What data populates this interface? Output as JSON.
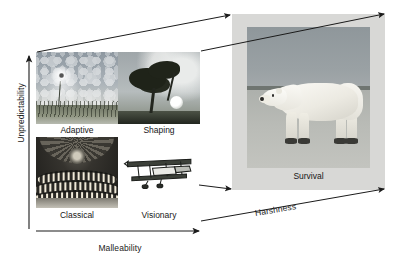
{
  "figure": {
    "axes": {
      "y_label": "Unpredictability",
      "x_label": "Malleability",
      "diagonal_label": "Harshness"
    },
    "matrix": {
      "cells": [
        {
          "id": "adaptive",
          "label": "Adaptive",
          "icon": "dandelion-seedhead-image",
          "quadrant": "top-left"
        },
        {
          "id": "shaping",
          "label": "Shaping",
          "icon": "wind-bent-tree-image",
          "quadrant": "top-right"
        },
        {
          "id": "classical",
          "label": "Classical",
          "icon": "opera-house-interior-image",
          "quadrant": "bottom-left"
        },
        {
          "id": "visionary",
          "label": "Visionary",
          "icon": "biplane-image",
          "quadrant": "bottom-right"
        }
      ]
    },
    "panel": {
      "label": "Survival",
      "icon": "polar-bear-photo"
    },
    "connectors": [
      {
        "from": "matrix-top-left",
        "to": "panel-top-left"
      },
      {
        "from": "matrix-top-right",
        "to": "panel-top-right"
      },
      {
        "from": "matrix-bottom-right",
        "to": "panel-bottom-left"
      },
      {
        "from": "matrix-bottom-right-outer",
        "to": "panel-bottom-right"
      }
    ],
    "colors": {
      "stroke": "#1b1b1b",
      "panel_frame": "#d8d8d6",
      "text": "#171717",
      "background": "#ffffff"
    }
  }
}
